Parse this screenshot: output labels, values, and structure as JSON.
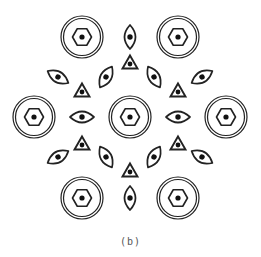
{
  "figure": {
    "caption": "(b)",
    "stroke_color": "#222222",
    "fill_color": "#111111"
  },
  "rings": [
    {
      "id": "center",
      "x": 130,
      "y": 117
    },
    {
      "id": "top-left",
      "x": 82,
      "y": 37
    },
    {
      "id": "top-right",
      "x": 178,
      "y": 37
    },
    {
      "id": "left",
      "x": 34,
      "y": 117
    },
    {
      "id": "right",
      "x": 226,
      "y": 117
    },
    {
      "id": "bottom-left",
      "x": 82,
      "y": 198
    },
    {
      "id": "bottom-right",
      "x": 178,
      "y": 198
    }
  ],
  "eyes": [
    {
      "x": 130,
      "y": 37,
      "angle": 90
    },
    {
      "x": 58,
      "y": 77,
      "angle": 30
    },
    {
      "x": 106,
      "y": 77,
      "angle": 120
    },
    {
      "x": 154,
      "y": 77,
      "angle": 60
    },
    {
      "x": 202,
      "y": 77,
      "angle": 150
    },
    {
      "x": 82,
      "y": 117,
      "angle": 0
    },
    {
      "x": 178,
      "y": 117,
      "angle": 0
    },
    {
      "x": 58,
      "y": 157,
      "angle": 150
    },
    {
      "x": 106,
      "y": 157,
      "angle": 60
    },
    {
      "x": 154,
      "y": 157,
      "angle": 120
    },
    {
      "x": 202,
      "y": 157,
      "angle": 30
    },
    {
      "x": 130,
      "y": 198,
      "angle": 90
    }
  ],
  "triangles": [
    {
      "x": 130,
      "y": 63
    },
    {
      "x": 82,
      "y": 91
    },
    {
      "x": 178,
      "y": 91
    },
    {
      "x": 82,
      "y": 144
    },
    {
      "x": 178,
      "y": 144
    },
    {
      "x": 130,
      "y": 171
    }
  ]
}
